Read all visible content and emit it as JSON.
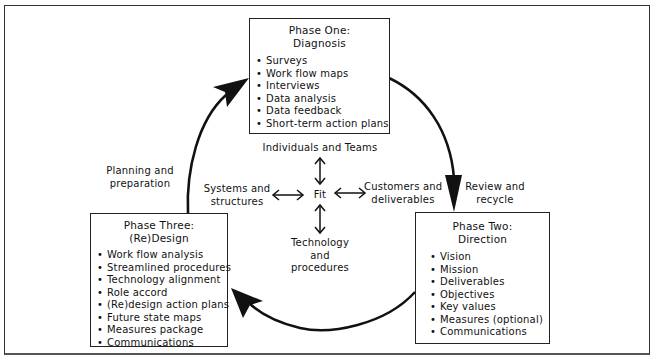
{
  "diagram": {
    "phases": [
      {
        "id": "phase-one",
        "title_line1": "Phase One:",
        "title_line2": "Diagnosis",
        "items": [
          "Surveys",
          "Work flow maps",
          "Interviews",
          "Data analysis",
          "Data feedback",
          "Short-term action plans"
        ]
      },
      {
        "id": "phase-two",
        "title_line1": "Phase Two:",
        "title_line2": "Direction",
        "items": [
          "Vision",
          "Mission",
          "Deliverables",
          "Objectives",
          "Key values",
          "Measures (optional)",
          "Communications"
        ]
      },
      {
        "id": "phase-three",
        "title_line1": "Phase Three:",
        "title_line2": "(Re)Design",
        "items": [
          "Work flow analysis",
          "Streamlined procedures",
          "Technology alignment",
          "Role accord",
          "(Re)design action plans",
          "Future state maps",
          "Measures package",
          "Communications"
        ]
      }
    ],
    "transitions": {
      "review": {
        "line1": "Review and",
        "line2": "recycle"
      },
      "planning": {
        "line1": "Planning and",
        "line2": "preparation"
      }
    },
    "fit": {
      "center": "Fit",
      "top": "Individuals and Teams",
      "left": {
        "line1": "Systems and",
        "line2": "structures"
      },
      "right": {
        "line1": "Customers and",
        "line2": "deliverables"
      },
      "bottom": {
        "line1": "Technology",
        "line2": "and",
        "line3": "procedures"
      }
    }
  }
}
